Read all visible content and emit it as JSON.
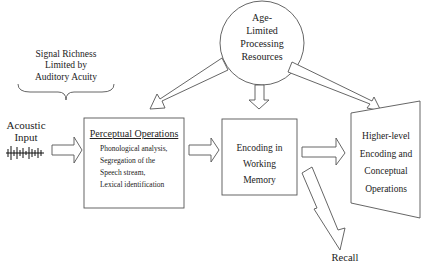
{
  "diagram": {
    "signal_note": [
      "Signal Richness",
      "Limited by",
      "Auditory Acuity"
    ],
    "resource_circle": [
      "Age-",
      "Limited",
      "Processing",
      "Resources"
    ],
    "input": [
      "Acoustic",
      "Input"
    ],
    "perceptual_box": {
      "title": "Perceptual Operations",
      "items": [
        "Phonological analysis,",
        "Segregation of the",
        "Speech stream,",
        "Lexical identification"
      ]
    },
    "working_memory_box": [
      "Encoding in",
      "Working",
      "Memory"
    ],
    "higher_level_box": [
      "Higher-level",
      "Encoding and",
      "Conceptual",
      "Operations"
    ],
    "recall": "Recall"
  }
}
